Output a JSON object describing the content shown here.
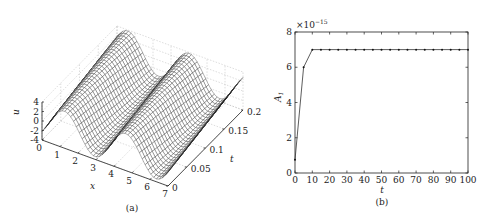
{
  "chart_data": [
    {
      "type": "surface",
      "panel": "(a)",
      "caption": "(a)",
      "xlabel": "x",
      "ylabel": "t",
      "zlabel": "u",
      "x_ticks": [
        "0",
        "1",
        "2",
        "3",
        "4",
        "5",
        "6",
        "7"
      ],
      "t_ticks": [
        "0",
        "0.05",
        "0.1",
        "0.15",
        "0.2"
      ],
      "u_ticks": [
        "4",
        "2",
        "0",
        "-2",
        "-4"
      ],
      "xlim": [
        0,
        7
      ],
      "tlim": [
        0,
        0.2
      ],
      "zlim": [
        -4,
        4
      ],
      "description": "Wireframe mesh surface u(x,t) showing two travelling wave crests along t; amplitude about 4, grid on (dotted)",
      "grid": true
    },
    {
      "type": "line",
      "panel": "(b)",
      "caption": "(b)",
      "xlabel": "t",
      "ylabel": "A_1",
      "ylabel_display": "A",
      "ylabel_sub": "1",
      "y_scale_label": "×10",
      "y_scale_exp": "−15",
      "x_ticks": [
        "0",
        "10",
        "20",
        "30",
        "40",
        "50",
        "60",
        "70",
        "80",
        "90",
        "100"
      ],
      "y_ticks": [
        "0",
        "2",
        "4",
        "6",
        "8"
      ],
      "xlim": [
        0,
        100
      ],
      "ylim": [
        0,
        8
      ],
      "grid": false,
      "series": [
        {
          "name": "A1",
          "marker": "dot",
          "x": [
            0,
            5,
            10,
            15,
            20,
            25,
            30,
            35,
            40,
            45,
            50,
            55,
            60,
            65,
            70,
            75,
            80,
            85,
            90,
            95,
            100
          ],
          "values": [
            0.75,
            6,
            7,
            7,
            7,
            7,
            7,
            7,
            7,
            7,
            7,
            7,
            7,
            7,
            7,
            7,
            7,
            7,
            7,
            7,
            7
          ]
        }
      ]
    }
  ]
}
